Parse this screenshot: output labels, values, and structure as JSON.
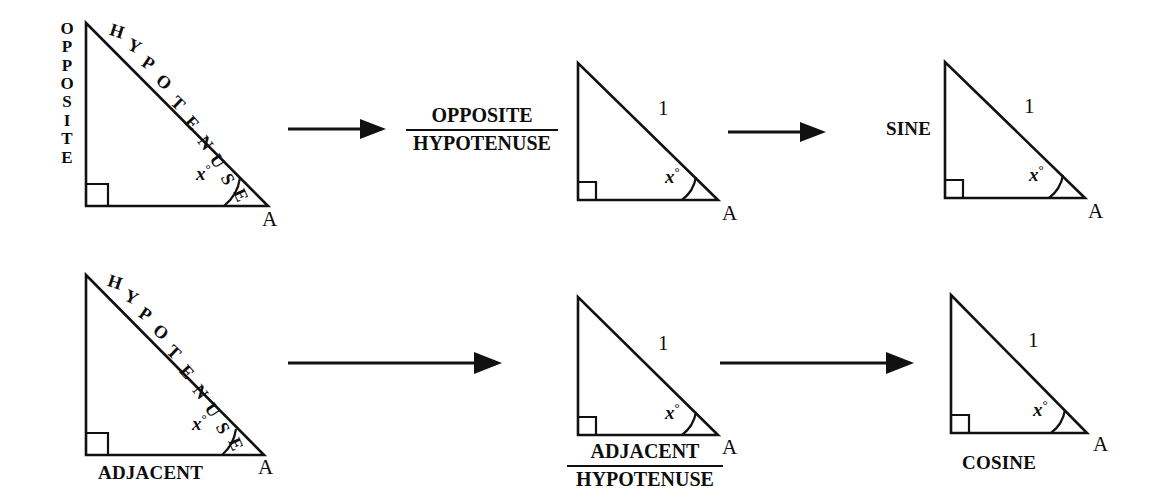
{
  "figure": {
    "ink_color": "#111111",
    "background": "#ffffff"
  },
  "common": {
    "vertex_label": "A",
    "angle_label": "x",
    "degree_symbol": "°",
    "unit_hypotenuse": "1",
    "hypotenuse_letters": [
      "H",
      "Y",
      "P",
      "O",
      "T",
      "E",
      "N",
      "U",
      "S",
      "E"
    ],
    "opposite_letters": [
      "O",
      "P",
      "P",
      "O",
      "S",
      "I",
      "T",
      "E"
    ]
  },
  "rows": [
    {
      "id": "sine-row",
      "steps": [
        {
          "id": "sine-triangle-labeled",
          "leg_label": "OPPOSITE",
          "hyp_label": "HYPOTENUSE",
          "angle": "x",
          "vertex": "A"
        },
        {
          "id": "sine-ratio",
          "numerator": "OPPOSITE",
          "denominator": "HYPOTENUSE"
        },
        {
          "id": "sine-unit-triangle",
          "hyp_value": "1",
          "angle": "x",
          "vertex": "A"
        },
        {
          "id": "sine-result-triangle",
          "leg_label": "SINE",
          "hyp_value": "1",
          "angle": "x",
          "vertex": "A"
        }
      ]
    },
    {
      "id": "cosine-row",
      "steps": [
        {
          "id": "cosine-triangle-labeled",
          "base_label": "ADJACENT",
          "hyp_label": "HYPOTENUSE",
          "angle": "x",
          "vertex": "A"
        },
        {
          "id": "cosine-unit-triangle",
          "hyp_value": "1",
          "numerator": "ADJACENT",
          "denominator": "HYPOTENUSE",
          "angle": "x",
          "vertex": "A"
        },
        {
          "id": "cosine-result-triangle",
          "base_label": "COSINE",
          "hyp_value": "1",
          "angle": "x",
          "vertex": "A"
        }
      ]
    }
  ],
  "arrows": [
    {
      "id": "arrow-top-left",
      "direction": "right"
    },
    {
      "id": "arrow-top-right",
      "direction": "right"
    },
    {
      "id": "arrow-bottom-left",
      "direction": "right"
    },
    {
      "id": "arrow-bottom-right",
      "direction": "right"
    }
  ]
}
